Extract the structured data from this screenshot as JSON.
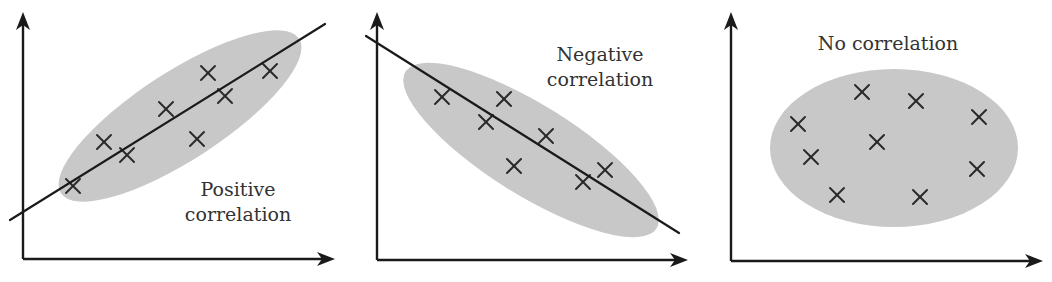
{
  "figure": {
    "panels": [
      {
        "id": "positive",
        "label_lines": [
          "Positive",
          "correlation"
        ],
        "label_pos": [
          {
            "x": 238,
            "y": 196
          },
          {
            "x": 238,
            "y": 221
          }
        ],
        "axis": {
          "origin": [
            23,
            259
          ],
          "y_top": 12,
          "x_right": 335
        },
        "ellipse": {
          "cx": 180,
          "cy": 116,
          "rx": 142,
          "ry": 44,
          "rotate": -33
        },
        "trend_line": {
          "x1": 10,
          "y1": 220,
          "x2": 325,
          "y2": 24
        },
        "points": [
          [
            73,
            186
          ],
          [
            104,
            142
          ],
          [
            127,
            155
          ],
          [
            166,
            109
          ],
          [
            197,
            139
          ],
          [
            208,
            73
          ],
          [
            225,
            96
          ],
          [
            270,
            71
          ]
        ]
      },
      {
        "id": "negative",
        "label_lines": [
          "Negative",
          "correlation"
        ],
        "label_pos": [
          {
            "x": 600,
            "y": 61
          },
          {
            "x": 600,
            "y": 86
          }
        ],
        "axis": {
          "origin": [
            377,
            260
          ],
          "y_top": 12,
          "x_right": 688
        },
        "ellipse": {
          "cx": 531,
          "cy": 150,
          "rx": 148,
          "ry": 45,
          "rotate": 32
        },
        "trend_line": {
          "x1": 366,
          "y1": 36,
          "x2": 679,
          "y2": 233
        },
        "points": [
          [
            442,
            97
          ],
          [
            504,
            99
          ],
          [
            486,
            122
          ],
          [
            546,
            136
          ],
          [
            514,
            166
          ],
          [
            583,
            182
          ],
          [
            605,
            170
          ]
        ]
      },
      {
        "id": "none",
        "label_lines": [
          "No correlation"
        ],
        "label_pos": [
          {
            "x": 888,
            "y": 50
          }
        ],
        "axis": {
          "origin": [
            731,
            261
          ],
          "y_top": 12,
          "x_right": 1043
        },
        "ellipse": {
          "cx": 894,
          "cy": 148,
          "rx": 124,
          "ry": 79,
          "rotate": 0
        },
        "trend_line": null,
        "points": [
          [
            798,
            124
          ],
          [
            811,
            157
          ],
          [
            837,
            195
          ],
          [
            862,
            92
          ],
          [
            877,
            142
          ],
          [
            916,
            101
          ],
          [
            920,
            197
          ],
          [
            979,
            117
          ],
          [
            977,
            169
          ]
        ]
      }
    ],
    "colors": {
      "ellipse": "#c8c8c8",
      "ink": "#1a1a1a",
      "text": "#333333"
    }
  },
  "chart_data": [
    {
      "type": "scatter",
      "title": "Positive correlation",
      "xlabel": "",
      "ylabel": "",
      "trend": "positive (line of best fit drawn)",
      "points": [
        [
          1.0,
          1.5
        ],
        [
          2.0,
          2.9
        ],
        [
          2.8,
          2.5
        ],
        [
          4.2,
          4.0
        ],
        [
          5.2,
          3.1
        ],
        [
          5.6,
          5.2
        ],
        [
          6.2,
          4.5
        ],
        [
          7.8,
          5.3
        ]
      ]
    },
    {
      "type": "scatter",
      "title": "Negative correlation",
      "xlabel": "",
      "ylabel": "",
      "trend": "negative (line of best fit drawn)",
      "points": [
        [
          2.1,
          5.2
        ],
        [
          4.1,
          5.1
        ],
        [
          3.5,
          4.4
        ],
        [
          5.5,
          4.0
        ],
        [
          4.5,
          3.0
        ],
        [
          6.7,
          2.5
        ],
        [
          7.4,
          2.9
        ]
      ]
    },
    {
      "type": "scatter",
      "title": "No correlation",
      "xlabel": "",
      "ylabel": "",
      "trend": "none",
      "points": [
        [
          2.2,
          4.2
        ],
        [
          2.6,
          3.2
        ],
        [
          3.4,
          2.0
        ],
        [
          4.2,
          5.2
        ],
        [
          4.7,
          3.7
        ],
        [
          6.0,
          4.9
        ],
        [
          6.1,
          1.9
        ],
        [
          8.0,
          4.4
        ],
        [
          8.0,
          2.8
        ]
      ]
    }
  ]
}
